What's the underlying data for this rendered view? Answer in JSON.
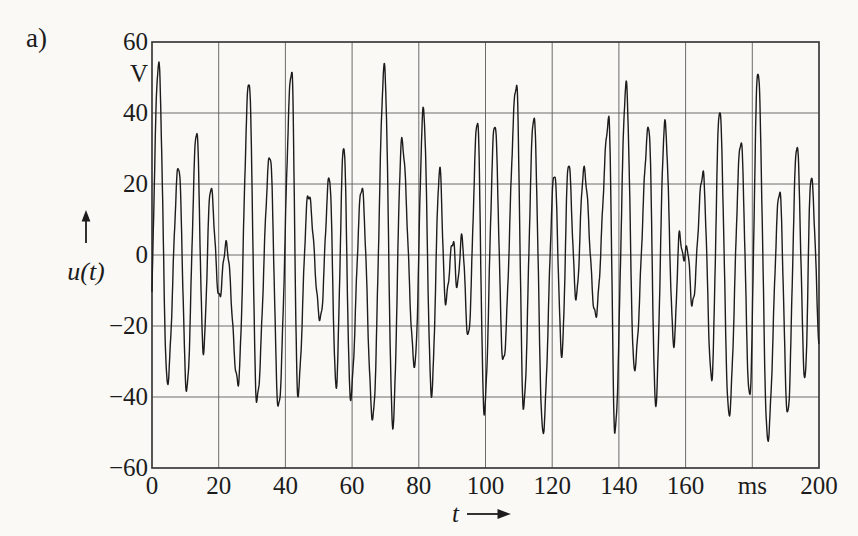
{
  "figure": {
    "panel_label": "a)",
    "background_color": "#faf9f6",
    "waveform_color": "#1c1c1c",
    "grid_color": "#5c5c5c",
    "frame_color": "#3a3a3a"
  },
  "chart_data": {
    "type": "line",
    "title": "",
    "xlabel": "t",
    "x_unit": "ms",
    "ylabel": "u(t)",
    "y_unit": "V",
    "xlim": [
      0,
      200
    ],
    "ylim": [
      -60,
      60
    ],
    "x_tick_step": 20,
    "y_tick_step": 20,
    "x_tick_values": [
      0,
      20,
      40,
      60,
      80,
      100,
      120,
      140,
      160,
      180,
      200
    ],
    "x_tick_labels": [
      "0",
      "20",
      "40",
      "60",
      "80",
      "100",
      "120",
      "140",
      "160",
      "ms",
      "200"
    ],
    "y_tick_values": [
      60,
      40,
      20,
      0,
      -20,
      -40,
      -60
    ],
    "y_tick_labels": [
      "60",
      "40",
      "20",
      "0",
      "−20",
      "−40",
      "−60"
    ],
    "grid": true,
    "legend": "none",
    "series": [
      {
        "name": "u(t)",
        "description": "Dense multi-tone voltage waveform; points are alternating local extrema [t in ms, u in V] read from the plot",
        "extremes": [
          [
            -1.2,
            -40
          ],
          [
            2,
            54
          ],
          [
            4.6,
            -36
          ],
          [
            8,
            25
          ],
          [
            10.4,
            -38
          ],
          [
            13.4,
            35
          ],
          [
            15.4,
            -27
          ],
          [
            17.6,
            19
          ],
          [
            20.2,
            -12
          ],
          [
            22.2,
            3
          ],
          [
            25.8,
            -36
          ],
          [
            29.1,
            49
          ],
          [
            31.4,
            -41
          ],
          [
            35.4,
            28
          ],
          [
            37.9,
            -43
          ],
          [
            41.9,
            52
          ],
          [
            43.7,
            -39
          ],
          [
            46.9,
            17
          ],
          [
            50.5,
            -18
          ],
          [
            53.2,
            22
          ],
          [
            55.2,
            -37
          ],
          [
            57.5,
            31
          ],
          [
            59.5,
            -40
          ],
          [
            62.9,
            19
          ],
          [
            66.2,
            -46
          ],
          [
            69.7,
            53
          ],
          [
            72.2,
            -48
          ],
          [
            74.9,
            32
          ],
          [
            78.8,
            -31
          ],
          [
            81.4,
            41
          ],
          [
            83.8,
            -39
          ],
          [
            86.3,
            24
          ],
          [
            88,
            -13
          ],
          [
            90.3,
            4
          ],
          [
            91.5,
            -9
          ],
          [
            92.9,
            5
          ],
          [
            94.8,
            -23
          ],
          [
            97.6,
            38
          ],
          [
            99.6,
            -44
          ],
          [
            102.8,
            37
          ],
          [
            105.3,
            -30
          ],
          [
            109.3,
            48
          ],
          [
            111.4,
            -43
          ],
          [
            114.5,
            39
          ],
          [
            117.2,
            -50
          ],
          [
            120.7,
            23
          ],
          [
            122.9,
            -28
          ],
          [
            124.9,
            26
          ],
          [
            127.2,
            -12
          ],
          [
            129.5,
            24
          ],
          [
            133,
            -17
          ],
          [
            137,
            38
          ],
          [
            138.8,
            -50
          ],
          [
            142.2,
            48
          ],
          [
            144.6,
            -32
          ],
          [
            149,
            36
          ],
          [
            151,
            -42
          ],
          [
            153.8,
            37
          ],
          [
            156.5,
            -25
          ],
          [
            158.2,
            6
          ],
          [
            159.3,
            -1
          ],
          [
            160.5,
            2
          ],
          [
            162,
            -14
          ],
          [
            165.2,
            23
          ],
          [
            167.8,
            -35
          ],
          [
            170.2,
            41
          ],
          [
            173,
            -45
          ],
          [
            176.6,
            32
          ],
          [
            179.2,
            -40
          ],
          [
            181.7,
            52
          ],
          [
            184.6,
            -52
          ],
          [
            188.2,
            18
          ],
          [
            190.6,
            -45
          ],
          [
            193.4,
            31
          ],
          [
            195.8,
            -35
          ],
          [
            197.6,
            22
          ],
          [
            200.8,
            -35
          ]
        ],
        "texture_ripple": {
          "amplitude_V": 1.1,
          "frequency_per_ms": 0.95
        }
      }
    ]
  }
}
